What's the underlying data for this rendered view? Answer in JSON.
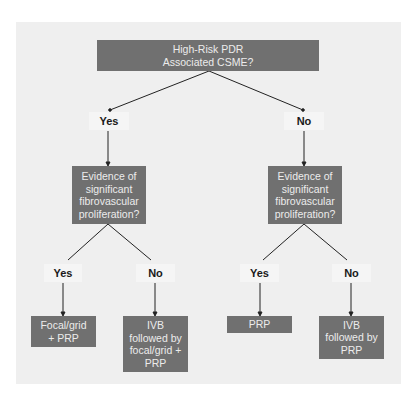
{
  "colors": {
    "panel_background": "#efefef",
    "box_fill": "#707070",
    "box_text": "#ececec",
    "label_background": "#f5f5f5",
    "label_text": "#1a1a1a",
    "line": "#222222"
  },
  "root": {
    "text": "High-Risk PDR\nAssociated CSME?"
  },
  "level1": [
    {
      "answer": "Yes",
      "question": "Evidence of\nsignificant\nfibrovascular\nproliferation?",
      "branches": [
        {
          "answer": "Yes",
          "result": "Focal/grid\n+ PRP"
        },
        {
          "answer": "No",
          "result": "IVB\nfollowed by\nfocal/grid +\nPRP"
        }
      ]
    },
    {
      "answer": "No",
      "question": "Evidence of\nsignificant\nfibrovascular\nproliferation?",
      "branches": [
        {
          "answer": "Yes",
          "result": "PRP"
        },
        {
          "answer": "No",
          "result": "IVB\nfollowed by\nPRP"
        }
      ]
    }
  ]
}
